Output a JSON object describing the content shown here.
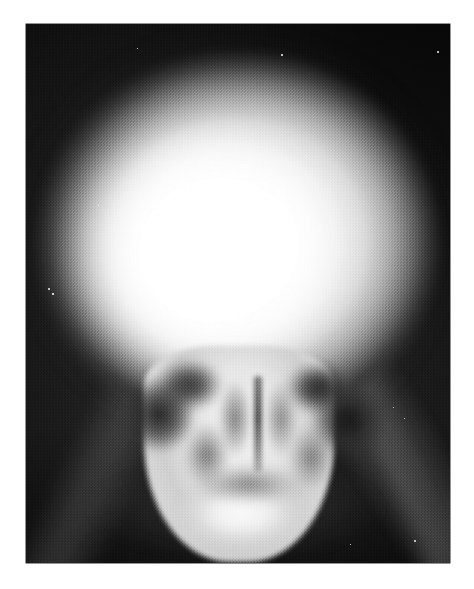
{
  "page": {
    "background_color": "#ffffff",
    "width": 474,
    "height": 589
  },
  "figure": {
    "kind": "radiograph",
    "modality": "plain-film-x-ray",
    "projection": "anteroposterior-skull",
    "film_background_color": "#0a0a0a",
    "bone_highlight_color": "#ffffff",
    "caption": "",
    "label": "",
    "plate_left": 26,
    "plate_top": 24,
    "plate_width": 424,
    "plate_height": 539
  },
  "anatomy": {
    "vault": "cranial-vault",
    "vault_core": "calvarium-lucency",
    "vault_halo": "scalp-soft-tissue-halo",
    "face": "facial-skeleton",
    "mandible": "mandible",
    "orbit_left": "left-orbit",
    "orbit_right": "right-orbit",
    "temporal_left": "left-temporal-fossa",
    "temporal_right": "right-temporal-fossa",
    "nasal_septum": "nasal-septum",
    "nasal_cavity_left": "left-nasal-cavity",
    "nasal_cavity_right": "right-nasal-cavity",
    "sinus_left": "left-maxillary-sinus",
    "sinus_right": "right-maxillary-sinus",
    "petrous": "petrous-ridge",
    "soft_tissue_left": "left-neck-soft-tissue",
    "soft_tissue_right": "right-neck-soft-tissue",
    "soft_tissue_bottom": "lower-neck-soft-tissue"
  },
  "artifacts": {
    "specks": [
      {
        "x": 48,
        "y": 288,
        "size": 2.0
      },
      {
        "x": 52,
        "y": 293,
        "size": 1.6
      },
      {
        "x": 281,
        "y": 54,
        "size": 1.8
      },
      {
        "x": 437,
        "y": 51,
        "size": 2.2
      },
      {
        "x": 414,
        "y": 540,
        "size": 2.0
      },
      {
        "x": 350,
        "y": 544,
        "size": 1.4
      },
      {
        "x": 137,
        "y": 48,
        "size": 1.2
      },
      {
        "x": 393,
        "y": 407,
        "size": 1.3
      },
      {
        "x": 404,
        "y": 418,
        "size": 1.2
      },
      {
        "x": 98,
        "y": 205,
        "size": 1.1
      }
    ]
  }
}
